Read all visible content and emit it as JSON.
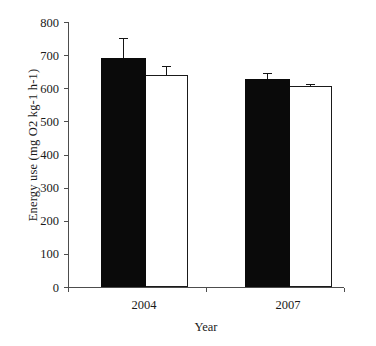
{
  "chart_data": {
    "type": "bar",
    "title": "",
    "xlabel": "Year",
    "ylabel": "Energy use (mg O2 kg-1 h-1)",
    "categories": [
      "2004",
      "2007"
    ],
    "ylim": [
      0,
      800
    ],
    "yticks": [
      0,
      100,
      200,
      300,
      400,
      500,
      600,
      700,
      800
    ],
    "ytick_labels": [
      "0",
      "100",
      "200",
      "300",
      "400",
      "500",
      "600",
      "700",
      "800"
    ],
    "grid": false,
    "legend": "none",
    "series": [
      {
        "name": "filled-bar-series",
        "fill": "#0a0a0a",
        "values": [
          690,
          628
        ],
        "errors": [
          61,
          18
        ]
      },
      {
        "name": "open-bar-series",
        "fill": "#ffffff",
        "values": [
          640,
          607
        ],
        "errors": [
          28,
          6
        ]
      }
    ]
  },
  "axes": {
    "y_axis_label": "Energy use (mg O2 kg-1 h-1)",
    "x_axis_label": "Year",
    "y_tick_labels": [
      "800",
      "700",
      "600",
      "500",
      "400",
      "300",
      "200",
      "100",
      "0"
    ],
    "x_tick_labels": [
      "2004",
      "2007"
    ]
  },
  "colors": {
    "filled_bar": "#0a0a0a",
    "open_bar": "#ffffff",
    "bar_outline": "#1a1a1a",
    "axis": "#4d4d4d",
    "text": "#1a1a1a",
    "background": "#ffffff"
  }
}
